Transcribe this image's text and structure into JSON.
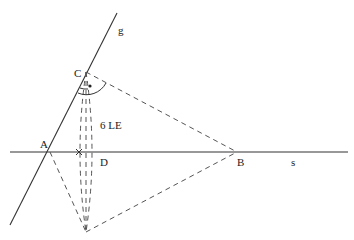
{
  "diagram": {
    "lines": {
      "g": {
        "label": "g",
        "from": [
          10,
          225
        ],
        "to": [
          117,
          13
        ]
      },
      "s": {
        "label": "s",
        "from": [
          10,
          152
        ],
        "to": [
          348,
          152
        ]
      }
    },
    "points": {
      "A": {
        "label": "A",
        "x": 50,
        "y": 152
      },
      "C": {
        "label": "C",
        "x": 86,
        "y": 72
      },
      "D": {
        "label": "D",
        "x": 86,
        "y": 152
      },
      "B": {
        "label": "B",
        "x": 237,
        "y": 152
      },
      "C_reflected": {
        "label": "",
        "x": 86,
        "y": 232
      }
    },
    "measure_label": "6 LE",
    "labels": {
      "g": "g",
      "s": "s",
      "A": "A",
      "B": "B",
      "C": "C",
      "D": "D",
      "measure": "6 LE"
    },
    "colors": {
      "line": "#333333",
      "dashed": "#555555",
      "background": "#ffffff"
    }
  }
}
